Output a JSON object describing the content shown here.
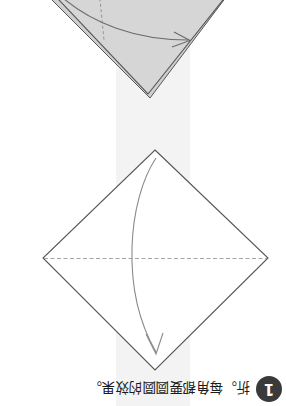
{
  "page": {
    "orientation": "rotated-180",
    "background_color": "#ffffff",
    "band_color": "#f1f1f1"
  },
  "colors": {
    "paper_gray_fill": "#d6d6d6",
    "paper_white_fill": "#ffffff",
    "outline": "#555555",
    "crease_dashed": "#8a8a8a",
    "arrow": "#6b6b6b",
    "badge_bg": "#3a3a3a",
    "badge_text": "#ffffff",
    "caption_text": "#1b1b1b"
  },
  "steps": [
    {
      "id": "step-upper",
      "name": "folded-paper-gray",
      "shape": "diamond-cropped",
      "fill": "#d6d6d6",
      "has_dashed_crease": true,
      "arrow": {
        "name": "fold-arrow-right",
        "direction": "right",
        "style": "curved"
      },
      "layered_edge": true
    },
    {
      "id": "step-lower",
      "name": "flat-square-white",
      "shape": "diamond",
      "fill": "#ffffff",
      "has_dashed_crease": true,
      "crease_orientation": "horizontal",
      "arrow": {
        "name": "fold-arrow-down",
        "direction": "down",
        "style": "curved"
      },
      "layered_edge": false
    }
  ],
  "caption": {
    "step_number": "1",
    "text": "折。每角都要圆圆的效果。"
  }
}
